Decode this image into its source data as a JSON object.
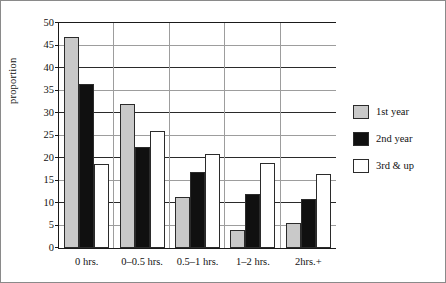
{
  "chart_data": {
    "type": "bar",
    "title": "",
    "subtitle": "",
    "xlabel": "",
    "ylabel": "proportion",
    "ylim": [
      0,
      50
    ],
    "yticks": [
      0,
      5,
      10,
      15,
      20,
      25,
      30,
      35,
      40,
      45,
      50
    ],
    "grid": true,
    "legend_position": "right",
    "categories": [
      "0 hrs.",
      "0–0.5 hrs.",
      "0.5–1 hrs.",
      "1–2 hrs.",
      "2hrs.+"
    ],
    "series": [
      {
        "name": "1st year",
        "color": "#c9c9c9",
        "values": [
          46.8,
          32.0,
          11.4,
          4.0,
          5.5
        ]
      },
      {
        "name": "2nd year",
        "color": "#101010",
        "values": [
          36.4,
          22.5,
          17.0,
          12.0,
          10.8
        ]
      },
      {
        "name": "3rd & up",
        "color": "#ffffff",
        "values": [
          18.7,
          26.0,
          20.8,
          19.0,
          16.5
        ]
      }
    ]
  },
  "legend": {
    "items": [
      {
        "label": "1st year"
      },
      {
        "label": "2nd year"
      },
      {
        "label": "3rd & up"
      }
    ]
  }
}
